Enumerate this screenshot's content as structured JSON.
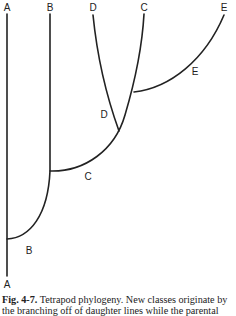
{
  "diagram": {
    "title": "Tetrapod phylogeny",
    "lineages": [
      {
        "id": "A",
        "top_label": "A",
        "bottom_label": "A"
      },
      {
        "id": "B",
        "top_label": "B",
        "branch_label": "B"
      },
      {
        "id": "C",
        "top_label": "C",
        "branch_label": "C"
      },
      {
        "id": "D",
        "top_label": "D",
        "branch_label": "D"
      },
      {
        "id": "E",
        "top_label": "E",
        "branch_label": "E"
      }
    ],
    "line_color": "#222222"
  },
  "caption": {
    "fig_label": "Fig. 4-7.",
    "line1": "Tetrapod phylogeny. New classes originate by",
    "line2": "the branching off of daughter lines while the parental"
  }
}
